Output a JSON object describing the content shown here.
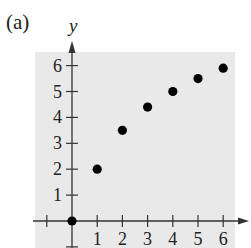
{
  "figure": {
    "part_label": "(a)"
  },
  "chart_data": {
    "type": "scatter",
    "title": "",
    "xlabel": "",
    "ylabel": "y",
    "x": [
      0,
      1,
      2,
      3,
      4,
      5,
      6
    ],
    "y": [
      0,
      2,
      3.5,
      4.4,
      5,
      5.5,
      5.9
    ],
    "x_ticks": [
      "1",
      "2",
      "3",
      "4",
      "5",
      "6"
    ],
    "y_ticks": [
      "1",
      "2",
      "3",
      "4",
      "5",
      "6"
    ],
    "xlim": [
      -1,
      7
    ],
    "ylim": [
      -1,
      7
    ],
    "grid": false,
    "background_color": "#e9e9e9",
    "point_color": "#000000",
    "legend": null
  }
}
